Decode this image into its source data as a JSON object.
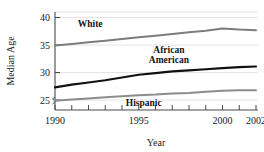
{
  "chart_data": {
    "type": "line",
    "title": "",
    "xlabel": "Year",
    "ylabel": "Median Age",
    "xlim": [
      1990,
      2002
    ],
    "ylim": [
      23.2,
      41
    ],
    "grid": true,
    "legend_position": "inline-on-lines",
    "x": [
      1990,
      1991,
      1992,
      1993,
      1994,
      1995,
      1996,
      1997,
      1998,
      1999,
      2000,
      2001,
      2002
    ],
    "x_tick_values": [
      1990,
      1991,
      1992,
      1993,
      1994,
      1995,
      1996,
      1997,
      1998,
      1999,
      2000,
      2001,
      2002
    ],
    "x_tick_labels": [
      "1990",
      "",
      "",
      "",
      "",
      "1995",
      "",
      "",
      "",
      "",
      "2000",
      "",
      "2002"
    ],
    "y_tick_values": [
      25,
      30,
      35,
      40
    ],
    "y_tick_labels": [
      "25",
      "30",
      "35",
      "40"
    ],
    "axis_break": true,
    "series": [
      {
        "name": "White",
        "color": "#7d7d7d",
        "width": 2.0,
        "values": [
          34.9,
          35.2,
          35.5,
          35.8,
          36.1,
          36.4,
          36.7,
          37.0,
          37.3,
          37.6,
          38.0,
          37.8,
          37.7
        ],
        "label_x": 1992.1,
        "label_y": 38.3
      },
      {
        "name": "African American",
        "color": "#111111",
        "width": 2.2,
        "values": [
          27.3,
          27.8,
          28.2,
          28.6,
          29.1,
          29.6,
          29.9,
          30.2,
          30.4,
          30.6,
          30.8,
          31.0,
          31.1
        ],
        "label_x": 1996.8,
        "label_y": 33.6
      },
      {
        "name": "Hispanic",
        "color": "#8c8c8c",
        "width": 2.0,
        "values": [
          24.9,
          25.1,
          25.3,
          25.5,
          25.7,
          25.9,
          26.0,
          26.2,
          26.3,
          26.5,
          26.7,
          26.8,
          26.8
        ],
        "label_x": 1995.3,
        "label_y": 23.9
      }
    ],
    "colors": {
      "axis": "#4a4a4a",
      "grid": "#e3e3e3",
      "text": "#1a1a1a",
      "background": "#ffffff"
    }
  }
}
